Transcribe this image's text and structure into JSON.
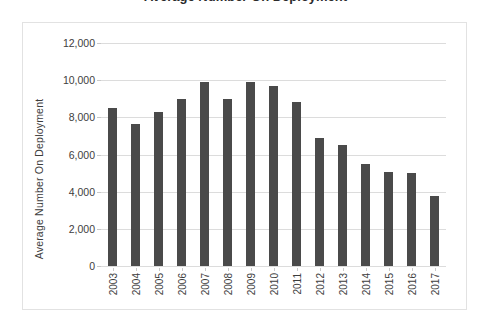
{
  "title": {
    "text": "Average Number On Deployment",
    "clipped": true
  },
  "chart_data": {
    "type": "bar",
    "title": "Average Number On Deployment",
    "subtitle": "",
    "xlabel": "",
    "ylabel": "Average Number On Deployment",
    "categories": [
      "2003",
      "2004",
      "2005",
      "2006",
      "2007",
      "2008",
      "2009",
      "2010",
      "2011",
      "2012",
      "2013",
      "2014",
      "2015",
      "2016",
      "2017"
    ],
    "values": [
      8500,
      7650,
      8300,
      9000,
      9900,
      9000,
      9900,
      9700,
      8800,
      6900,
      6500,
      5500,
      5050,
      5000,
      3750
    ],
    "ylim": [
      0,
      12000
    ],
    "ytick_values": [
      0,
      2000,
      4000,
      6000,
      8000,
      10000,
      12000
    ],
    "ytick_labels": [
      "0",
      "2,000",
      "4,000",
      "6,000",
      "8,000",
      "10,000",
      "12,000"
    ],
    "grid": "horizontal",
    "legend": "none",
    "bar_color": "#4a4a4a",
    "gridline_color": "#dcdcdc",
    "plot_background": "#ffffff",
    "border_color": "#e2e2e2",
    "xtick_rotation": -90
  }
}
